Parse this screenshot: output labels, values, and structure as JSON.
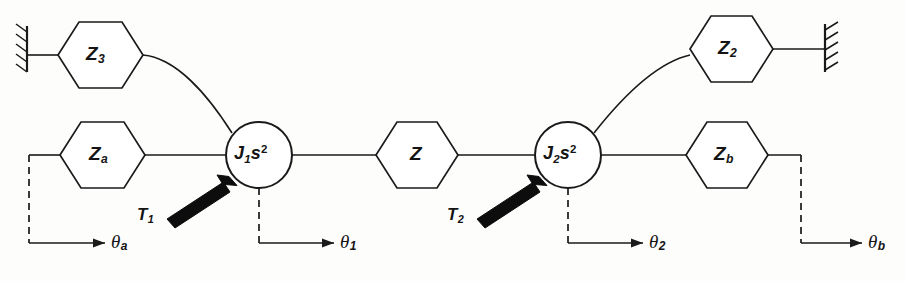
{
  "figure": {
    "type": "mechanical-impedance-network-diagram",
    "stroke_color": "#1a1a1a",
    "background_color": "#fdfdfc"
  },
  "nodes": {
    "inertia_1": {
      "label_base": "J",
      "label_sub": "1",
      "label_tail": "s",
      "label_sup": "2",
      "full": "J1s2"
    },
    "inertia_2": {
      "label_base": "J",
      "label_sub": "2",
      "label_tail": "s",
      "label_sup": "2",
      "full": "J2s2"
    }
  },
  "impedances": [
    {
      "id": "Z3",
      "base": "Z",
      "sub": "3",
      "position": "top-left"
    },
    {
      "id": "Za",
      "base": "Z",
      "sub": "a",
      "position": "middle-left"
    },
    {
      "id": "Z",
      "base": "Z",
      "sub": "",
      "position": "center"
    },
    {
      "id": "Z2",
      "base": "Z",
      "sub": "2",
      "position": "top-right"
    },
    {
      "id": "Zb",
      "base": "Z",
      "sub": "b",
      "position": "middle-right"
    }
  ],
  "torques": [
    {
      "id": "T1",
      "base": "T",
      "sub": "1"
    },
    {
      "id": "T2",
      "base": "T",
      "sub": "2"
    }
  ],
  "displacements": [
    {
      "id": "theta_a",
      "base": "θ",
      "sub": "a"
    },
    {
      "id": "theta_1",
      "base": "θ",
      "sub": "1"
    },
    {
      "id": "theta_2",
      "base": "θ",
      "sub": "2"
    },
    {
      "id": "theta_b",
      "base": "θ",
      "sub": "b"
    }
  ],
  "supports": [
    {
      "id": "wall-left",
      "side": "left",
      "attached_to": "Z3"
    },
    {
      "id": "wall-right",
      "side": "right",
      "attached_to": "Z2"
    }
  ]
}
